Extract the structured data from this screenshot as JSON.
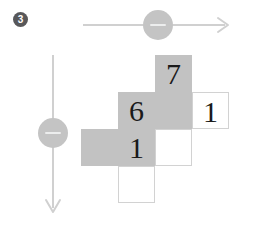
{
  "badge": {
    "label": "3",
    "glyph": "❶",
    "color": "#58585a"
  },
  "axes": {
    "horizontal": {
      "name": "horizontal-axis",
      "direction": "right",
      "color": "#d0d0d0",
      "x1": 83,
      "y1": 25,
      "x2": 228,
      "y2": 25
    },
    "vertical": {
      "name": "vertical-axis",
      "direction": "down",
      "color": "#d0d0d0",
      "x1": 53,
      "y1": 55,
      "x2": 53,
      "y2": 212
    }
  },
  "sliders": [
    {
      "name": "horizontal-slider-knob",
      "icon": "minus-icon",
      "color": "#c4c4c4",
      "cx": 158,
      "cy": 25
    },
    {
      "name": "vertical-slider-knob",
      "icon": "minus-icon",
      "color": "#c4c4c4",
      "cx": 53,
      "cy": 133
    }
  ],
  "grid": {
    "cell_size": 37,
    "origin_x": 81,
    "origin_y": 55,
    "fill_color": "#c2c2c2",
    "blank_border_color": "#d2d2d2",
    "cells": [
      {
        "id": "cell-r0c2",
        "row": 0,
        "col": 2,
        "value": "7",
        "style": "filled"
      },
      {
        "id": "cell-r1c1",
        "row": 1,
        "col": 1,
        "value": "6",
        "style": "filled"
      },
      {
        "id": "cell-r1c2",
        "row": 1,
        "col": 2,
        "value": "",
        "style": "filled"
      },
      {
        "id": "cell-r1c3",
        "row": 1,
        "col": 3,
        "value": "1",
        "style": "blank"
      },
      {
        "id": "cell-r2c0",
        "row": 2,
        "col": 0,
        "value": "",
        "style": "filled"
      },
      {
        "id": "cell-r2c1",
        "row": 2,
        "col": 1,
        "value": "1",
        "style": "filled"
      },
      {
        "id": "cell-r2c2",
        "row": 2,
        "col": 2,
        "value": "",
        "style": "blank"
      },
      {
        "id": "cell-r3c1",
        "row": 3,
        "col": 1,
        "value": "",
        "style": "blank"
      }
    ]
  }
}
